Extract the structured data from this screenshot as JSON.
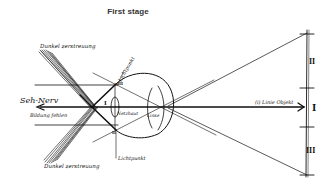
{
  "title": "First stage",
  "diagram": {
    "labels": {
      "upper_band": "Dunkel zerstreuung",
      "lower_band": "Dunkel zerstreuung",
      "left_arrow_top": "Seh-Nerv",
      "left_arrow_bottom": "Bildung fehlen",
      "upper_point": "Lichtpunkt",
      "lower_point": "Lichtpunkt",
      "inner_lens": "Netzhaut",
      "eye_lens": "Linse",
      "axis_label": "(i) Linie Objekt",
      "roman_upper_small": "III",
      "roman_center_small": "I",
      "roman_lower_small": "II",
      "segment_upper": "II",
      "segment_center": "I",
      "segment_lower": "III"
    },
    "colors": {
      "ink": "#111111",
      "background": "#ffffff"
    }
  }
}
